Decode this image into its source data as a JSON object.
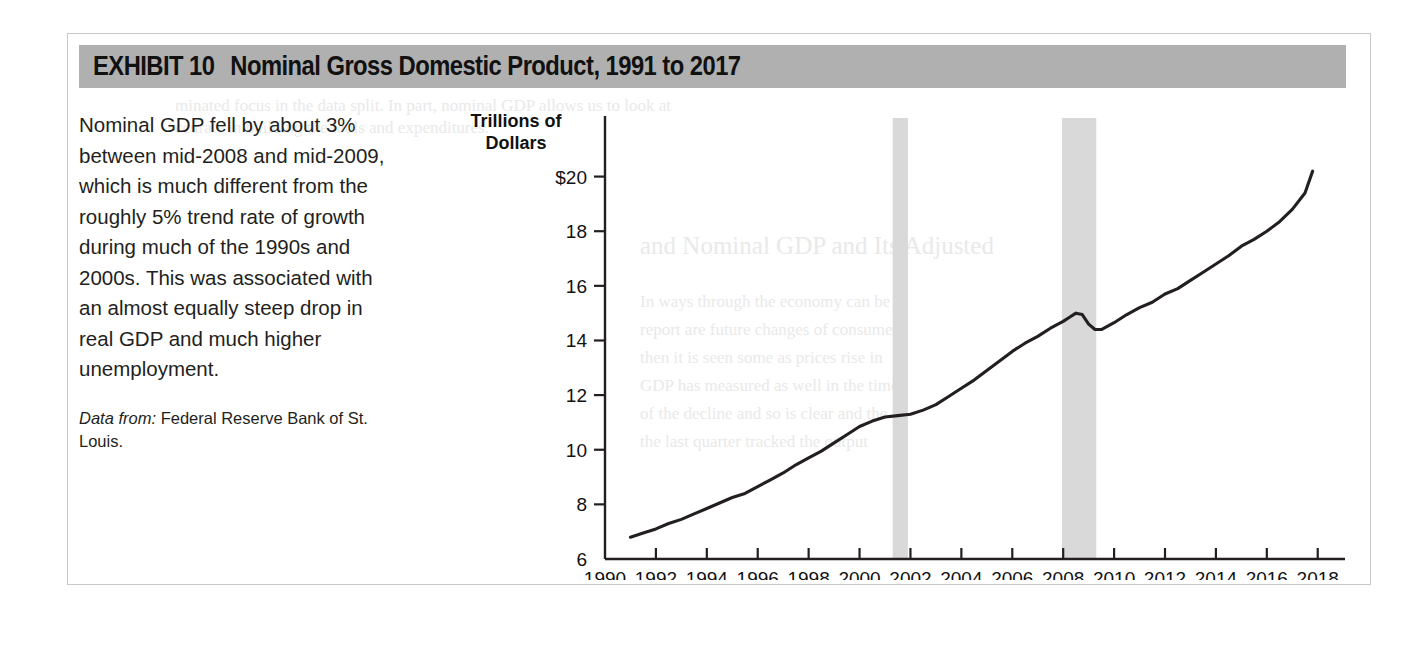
{
  "exhibit": {
    "number_label": "EXHIBIT 10",
    "title": "Nominal Gross Domestic Product, 1991 to 2017"
  },
  "caption": {
    "body": "Nominal GDP fell by about 3% between mid-2008 and mid-2009, which is much different from the roughly 5% trend rate of growth during much of the 1990s and 2000s. This was associated with an almost equally steep drop in real GDP and much higher unemployment.",
    "source_label": "Data from:",
    "source_text": "Federal Reserve Bank of St. Louis."
  },
  "colors": {
    "title_bar": "#b0b0b0",
    "recession_band": "#d9d9d9",
    "line": "#231f20",
    "axis": "#231f20",
    "frame": "#c9c9c9"
  },
  "ghost_text": [
    {
      "text": "minated focus in the data split. In part, nominal GDP allows us to look at",
      "x": 175,
      "y": 96,
      "size": 17
    },
    {
      "text": "ccurate in building the tools and expenditures.",
      "x": 175,
      "y": 118,
      "size": 17
    },
    {
      "text": "and Nominal GDP and Its Adjusted",
      "x": 640,
      "y": 232,
      "size": 25
    },
    {
      "text": "In ways through the economy can be",
      "x": 640,
      "y": 292,
      "size": 17
    },
    {
      "text": "report are future changes of consumer",
      "x": 640,
      "y": 320,
      "size": 17
    },
    {
      "text": "then it is seen some as prices rise in",
      "x": 640,
      "y": 348,
      "size": 17
    },
    {
      "text": "GDP has measured as well in the time",
      "x": 640,
      "y": 376,
      "size": 17
    },
    {
      "text": "of the decline and so is clear and the",
      "x": 640,
      "y": 404,
      "size": 17
    },
    {
      "text": "the last quarter tracked the output",
      "x": 640,
      "y": 432,
      "size": 17
    }
  ],
  "chart_data": {
    "type": "line",
    "title": "Nominal Gross Domestic Product, 1991 to 2017",
    "xlabel": "Year",
    "ylabel": "Trillions of Dollars",
    "ylabel_lines": [
      "Trillions of",
      "Dollars"
    ],
    "xlim": [
      1990,
      2018.6
    ],
    "ylim": [
      6,
      20.9
    ],
    "ytick_values": [
      6,
      8,
      10,
      12,
      14,
      16,
      18,
      20
    ],
    "ytick_labels": [
      "6",
      "8",
      "10",
      "12",
      "14",
      "16",
      "18",
      "$20"
    ],
    "xtick_values": [
      1990,
      1992,
      1994,
      1996,
      1998,
      2000,
      2002,
      2004,
      2006,
      2008,
      2010,
      2012,
      2014,
      2016,
      2018
    ],
    "xtick_labels": [
      "1990",
      "1992",
      "1994",
      "1996",
      "1998",
      "2000",
      "2002",
      "2004",
      "2006",
      "2008",
      "2010",
      "2012",
      "2014",
      "2016",
      "2018"
    ],
    "grid": false,
    "legend": "none",
    "series": [
      {
        "name": "Nominal GDP",
        "units": "trillions of dollars",
        "x": [
          1991.0,
          1991.5,
          1992.0,
          1992.5,
          1993.0,
          1993.5,
          1994.0,
          1994.5,
          1995.0,
          1995.5,
          1996.0,
          1996.5,
          1997.0,
          1997.5,
          1998.0,
          1998.5,
          1999.0,
          1999.5,
          2000.0,
          2000.5,
          2001.0,
          2001.5,
          2002.0,
          2002.5,
          2003.0,
          2003.5,
          2004.0,
          2004.5,
          2005.0,
          2005.5,
          2006.0,
          2006.5,
          2007.0,
          2007.5,
          2008.0,
          2008.25,
          2008.5,
          2008.75,
          2009.0,
          2009.25,
          2009.5,
          2010.0,
          2010.5,
          2011.0,
          2011.5,
          2012.0,
          2012.5,
          2013.0,
          2013.5,
          2014.0,
          2014.5,
          2015.0,
          2015.5,
          2016.0,
          2016.5,
          2017.0,
          2017.5,
          2017.8
        ],
        "y": [
          6.8,
          6.95,
          7.1,
          7.3,
          7.45,
          7.65,
          7.85,
          8.05,
          8.25,
          8.4,
          8.65,
          8.9,
          9.15,
          9.45,
          9.7,
          9.95,
          10.25,
          10.55,
          10.85,
          11.05,
          11.2,
          11.25,
          11.3,
          11.45,
          11.65,
          11.95,
          12.25,
          12.55,
          12.9,
          13.25,
          13.6,
          13.9,
          14.15,
          14.45,
          14.7,
          14.85,
          15.0,
          14.95,
          14.6,
          14.4,
          14.4,
          14.65,
          14.95,
          15.2,
          15.4,
          15.7,
          15.9,
          16.2,
          16.5,
          16.8,
          17.1,
          17.45,
          17.7,
          18.0,
          18.35,
          18.8,
          19.4,
          20.2
        ]
      }
    ],
    "shaded_regions": [
      {
        "name": "2001 recession",
        "x_start": 2001.3,
        "x_end": 2001.9,
        "color": "#d9d9d9"
      },
      {
        "name": "2008-2009 recession",
        "x_start": 2007.95,
        "x_end": 2009.3,
        "color": "#d9d9d9"
      }
    ]
  }
}
